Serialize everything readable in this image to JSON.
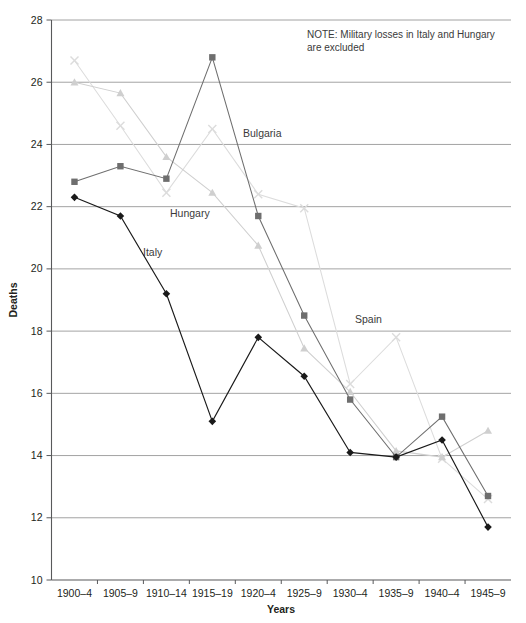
{
  "chart_data": {
    "type": "line",
    "title": "",
    "xlabel": "Years",
    "ylabel": "Deaths",
    "ylim": [
      10,
      28
    ],
    "yticks": [
      10,
      12,
      14,
      16,
      18,
      20,
      22,
      24,
      26,
      28
    ],
    "grid": true,
    "legend_position": "inline-labels",
    "categories": [
      "1900–4",
      "1905–9",
      "1910–14",
      "1915–19",
      "1920–4",
      "1925–9",
      "1930–4",
      "1935–9",
      "1940–4",
      "1945–9"
    ],
    "annotations": [
      {
        "name": "note",
        "text": "NOTE: Military losses in Italy and Hungary are excluded"
      }
    ],
    "series": [
      {
        "name": "Italy",
        "marker": "diamond",
        "color": "#1a1a1a",
        "values": [
          22.3,
          21.7,
          19.2,
          15.1,
          17.8,
          16.55,
          14.1,
          13.95,
          14.5,
          11.7
        ]
      },
      {
        "name": "Bulgaria",
        "marker": "square",
        "color": "#6e6e6e",
        "values": [
          22.8,
          23.3,
          22.9,
          26.8,
          21.7,
          18.5,
          15.8,
          13.95,
          15.25,
          12.7
        ]
      },
      {
        "name": "Hungary",
        "marker": "triangle",
        "color": "#cfcfcf",
        "values": [
          26.0,
          25.65,
          23.6,
          22.45,
          20.75,
          17.45,
          16.05,
          14.15,
          13.95,
          14.8
        ]
      },
      {
        "name": "Spain",
        "marker": "x",
        "color": "#dcdcdc",
        "values": [
          26.7,
          24.6,
          22.45,
          24.5,
          22.4,
          21.95,
          16.3,
          17.8,
          13.9,
          12.6
        ]
      }
    ]
  },
  "note": {
    "line1": "NOTE: Military losses in Italy and Hungary",
    "line2": "are excluded"
  },
  "labels": {
    "bulgaria": "Bulgaria",
    "hungary": "Hungary",
    "italy": "Italy",
    "spain": "Spain"
  }
}
